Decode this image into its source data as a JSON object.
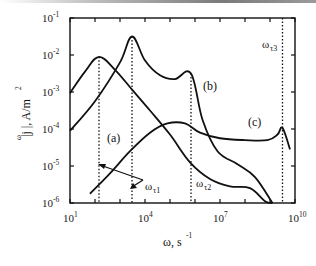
{
  "chart_data": {
    "type": "line",
    "title": "",
    "xlabel": "ω, s⁻¹",
    "ylabel": "|j^ω|, A/m²",
    "x_scale": "log",
    "y_scale": "log",
    "xlim": [
      10,
      10000000000
    ],
    "ylim": [
      1e-06,
      0.1
    ],
    "x_ticks": [
      {
        "base": "10",
        "exp": "1"
      },
      {
        "base": "10",
        "exp": "4"
      },
      {
        "base": "10",
        "exp": "7"
      },
      {
        "base": "10",
        "exp": "10"
      }
    ],
    "y_ticks": [
      {
        "base": "10",
        "exp": "-1"
      },
      {
        "base": "10",
        "exp": "-2"
      },
      {
        "base": "10",
        "exp": "-3"
      },
      {
        "base": "10",
        "exp": "-4"
      },
      {
        "base": "10",
        "exp": "-5"
      },
      {
        "base": "10",
        "exp": "-6"
      }
    ],
    "grid": false,
    "series": [
      {
        "name": "(a)",
        "log10_x": [
          1.0,
          1.6,
          2.16,
          2.8,
          3.5,
          4.2,
          5.0,
          5.8,
          6.6,
          7.4,
          8.2,
          8.8,
          9.1
        ],
        "log10_y": [
          -3.03,
          -2.45,
          -2.05,
          -2.4,
          -2.95,
          -3.5,
          -4.15,
          -4.9,
          -5.35,
          -5.55,
          -5.6,
          -5.95,
          -6.0
        ]
      },
      {
        "name": "(b)",
        "log10_x": [
          1.0,
          2.0,
          3.0,
          3.48,
          4.0,
          4.6,
          5.2,
          5.84,
          6.3,
          6.9,
          7.7,
          8.4,
          9.1
        ],
        "log10_y": [
          -4.05,
          -3.25,
          -2.2,
          -1.5,
          -2.15,
          -2.55,
          -2.65,
          -2.5,
          -3.75,
          -4.6,
          -4.95,
          -5.3,
          -6.0
        ]
      },
      {
        "name": "(c)",
        "log10_x": [
          1.8,
          2.6,
          3.4,
          4.2,
          4.9,
          5.6,
          6.2,
          7.0,
          8.0,
          8.9,
          9.3,
          9.5,
          9.8
        ],
        "log10_y": [
          -5.75,
          -5.2,
          -4.6,
          -4.1,
          -3.85,
          -3.85,
          -4.1,
          -4.25,
          -4.3,
          -4.3,
          -4.15,
          -3.97,
          -4.55
        ]
      }
    ],
    "annotations": [
      {
        "text": "ωτ1",
        "log10_x": [
          2.16,
          3.48
        ],
        "note": "relaxation frequencies marked by dotted lines for curves (a) and (b)"
      },
      {
        "text": "ωτ2",
        "log10_x": 5.84
      },
      {
        "text": "ωτ3",
        "log10_x": 9.5
      }
    ]
  },
  "axis": {
    "x_label_main": "ω, s",
    "x_label_sup": "-1",
    "y_label": "|j  |, A/m",
    "y_label_sup_omega": "ω",
    "y_label_sup_2": "2"
  },
  "labels": {
    "a": "(a)",
    "b": "(b)",
    "c": "(c)",
    "omega": "ω",
    "tau1": "τ1",
    "tau2": "τ2",
    "tau3": "τ3"
  }
}
